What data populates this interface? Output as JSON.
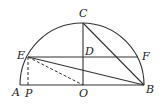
{
  "figure": {
    "type": "semicircle geometry diagram",
    "points": {
      "A": "A",
      "P": "P",
      "O": "O",
      "B": "B",
      "C": "C",
      "D": "D",
      "E": "E",
      "F": "F"
    },
    "segments": [
      {
        "from": "A",
        "to": "B",
        "style": "solid"
      },
      {
        "from": "C",
        "to": "O",
        "style": "solid"
      },
      {
        "from": "E",
        "to": "F",
        "style": "solid"
      },
      {
        "from": "C",
        "to": "B",
        "style": "solid"
      },
      {
        "from": "E",
        "to": "B",
        "style": "solid"
      },
      {
        "from": "E",
        "to": "P",
        "style": "dashed"
      },
      {
        "from": "E",
        "to": "O",
        "style": "dashed"
      }
    ],
    "arc": "semicircle centered at O through A, C, B"
  }
}
